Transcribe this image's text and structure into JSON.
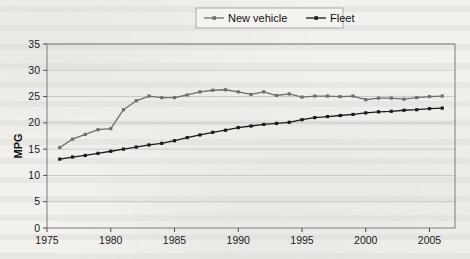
{
  "page": {
    "kind": "scanned-document-figure",
    "background_color": "#f2f1ee"
  },
  "chart_data": {
    "type": "line",
    "title": "",
    "xlabel": "",
    "ylabel": "MPG",
    "xlim": [
      1975,
      2007
    ],
    "ylim": [
      0,
      35
    ],
    "ytick_step": 5,
    "yticks": [
      "0",
      "5",
      "10",
      "15",
      "20",
      "25",
      "30",
      "35"
    ],
    "xticks": [
      "1975",
      "1980",
      "1985",
      "1990",
      "1995",
      "2000",
      "2005"
    ],
    "xtick_values": [
      1975,
      1980,
      1985,
      1990,
      1995,
      2000,
      2005
    ],
    "grid": "horizontal",
    "legend_position": "top-center",
    "x": [
      1976,
      1977,
      1978,
      1979,
      1980,
      1981,
      1982,
      1983,
      1984,
      1985,
      1986,
      1987,
      1988,
      1989,
      1990,
      1991,
      1992,
      1993,
      1994,
      1995,
      1996,
      1997,
      1998,
      1999,
      2000,
      2001,
      2002,
      2003,
      2004,
      2005,
      2006
    ],
    "series": [
      {
        "name": "New vehicle",
        "color": "#6e6e6e",
        "marker": "square",
        "values": [
          15.3,
          16.9,
          17.8,
          18.7,
          18.9,
          22.5,
          24.2,
          25.1,
          24.8,
          24.8,
          25.3,
          25.9,
          26.2,
          26.3,
          25.9,
          25.4,
          25.9,
          25.2,
          25.5,
          24.9,
          25.1,
          25.1,
          25.0,
          25.1,
          24.4,
          24.7,
          24.7,
          24.5,
          24.8,
          25.0,
          25.1
        ]
      },
      {
        "name": "Fleet",
        "color": "#1a1a1a",
        "marker": "square",
        "values": [
          13.1,
          13.5,
          13.8,
          14.2,
          14.6,
          15.0,
          15.4,
          15.8,
          16.1,
          16.6,
          17.2,
          17.7,
          18.2,
          18.6,
          19.1,
          19.4,
          19.7,
          19.9,
          20.1,
          20.6,
          21.0,
          21.2,
          21.4,
          21.6,
          21.9,
          22.1,
          22.2,
          22.4,
          22.5,
          22.7,
          22.8
        ]
      }
    ]
  },
  "legend": {
    "items": [
      {
        "label": "New vehicle"
      },
      {
        "label": "Fleet"
      }
    ]
  }
}
